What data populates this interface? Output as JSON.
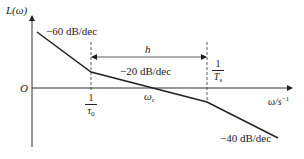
{
  "diagram": {
    "type": "bode-asymptotic-magnitude-plot",
    "y_axis_label": "L(ω)",
    "x_axis_label": "ω/s",
    "x_axis_label_exp": "−1",
    "origin_label": "O",
    "segments": [
      {
        "slope_label": "−60 dB/dec"
      },
      {
        "slope_label": "−20 dB/dec"
      },
      {
        "slope_label": "−40 dB/dec"
      }
    ],
    "breakpoints": [
      {
        "num": "1",
        "den": "τ",
        "den_sub": "0"
      },
      {
        "num": "1",
        "den": "T",
        "den_sub": "s"
      }
    ],
    "crossover_label": "ω",
    "crossover_sub": "c",
    "span_label": "h",
    "colors": {
      "line": "#222222",
      "axis": "#333333",
      "background": "#ffffff"
    }
  }
}
